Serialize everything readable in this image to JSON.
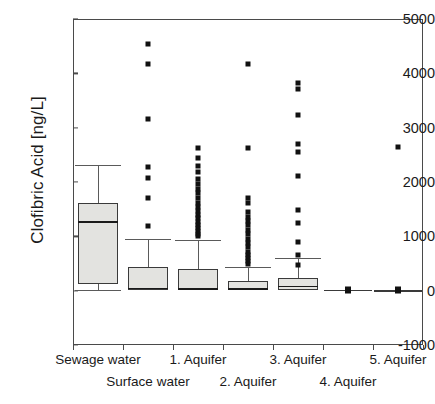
{
  "chart": {
    "type": "boxplot",
    "ylabel": "Clofibric Acid [ng/L]",
    "xlabel": ""
  },
  "axis": {
    "y_ticks": [
      "5000",
      "4000",
      "3000",
      "2000",
      "1000",
      "0",
      "-1000"
    ],
    "y_min": -1000,
    "y_max": 5000,
    "x_categories": [
      "Sewage water",
      "Surface water",
      "1. Aquifer",
      "2. Aquifer",
      "3. Aquifer",
      "4. Aquifer",
      "5. Aquifer"
    ]
  },
  "chart_data": {
    "type": "boxplot",
    "title": "",
    "xlabel": "",
    "ylabel": "Clofibric Acid [ng/L]",
    "ylim": [
      -1000,
      5000
    ],
    "yticks": [
      -1000,
      0,
      1000,
      2000,
      3000,
      4000,
      5000
    ],
    "grid": false,
    "legend": "none",
    "categories": [
      "Sewage water",
      "Surface water",
      "1. Aquifer",
      "2. Aquifer",
      "3. Aquifer",
      "4. Aquifer",
      "5. Aquifer"
    ],
    "boxes": [
      {
        "category": "Sewage water",
        "whisker_low": 20,
        "q1": 120,
        "median": 1280,
        "q3": 1620,
        "whisker_high": 2320,
        "outliers": []
      },
      {
        "category": "Surface water",
        "whisker_low": 0,
        "q1": 10,
        "median": 55,
        "q3": 430,
        "whisker_high": 950,
        "outliers": [
          4540,
          4180,
          3160,
          2270,
          2080,
          1700,
          1190
        ]
      },
      {
        "category": "1. Aquifer",
        "whisker_low": 0,
        "q1": 10,
        "median": 50,
        "q3": 400,
        "whisker_high": 940,
        "outliers": [
          2620,
          2450,
          2300,
          2180,
          2060,
          1960,
          1870,
          1790,
          1700,
          1620,
          1540,
          1470,
          1400,
          1330,
          1270,
          1210,
          1150,
          1100,
          1050,
          1010
        ]
      },
      {
        "category": "2. Aquifer",
        "whisker_low": 0,
        "q1": 10,
        "median": 40,
        "q3": 180,
        "whisker_high": 440,
        "outliers": [
          4180,
          2620,
          1700,
          1620,
          1450,
          1350,
          1280,
          1200,
          1120,
          1040,
          960,
          880,
          800,
          720,
          660,
          600,
          540,
          500
        ]
      },
      {
        "category": "3. Aquifer",
        "whisker_low": 0,
        "q1": 10,
        "median": 90,
        "q3": 230,
        "whisker_high": 600,
        "outliers": [
          3830,
          3720,
          3230,
          2700,
          2560,
          2110,
          1490,
          1250,
          900,
          660,
          480
        ]
      },
      {
        "category": "4. Aquifer",
        "whisker_low": 0,
        "q1": 0,
        "median": 20,
        "q3": 40,
        "whisker_high": 60,
        "outliers": []
      },
      {
        "category": "5. Aquifer",
        "whisker_low": 0,
        "q1": 0,
        "median": 10,
        "q3": 20,
        "whisker_high": 30,
        "outliers": [
          2650
        ]
      }
    ]
  }
}
